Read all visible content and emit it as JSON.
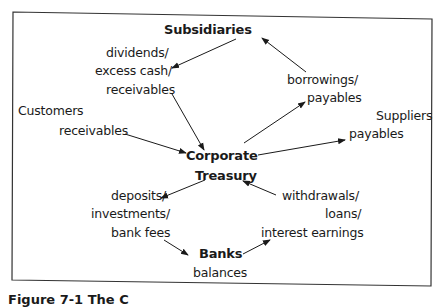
{
  "diagram": {
    "nodes": {
      "subsidiaries": "Subsidiaries",
      "corporate": "Corporate",
      "treasury": "Treasury",
      "banks": "Banks",
      "customers": "Customers",
      "suppliers": "Suppliers"
    },
    "flows": {
      "subsidiaries_to_treasury": [
        "dividends/",
        "excess cash/",
        "receivables"
      ],
      "treasury_to_subsidiaries": [
        "borrowings/",
        "payables"
      ],
      "customers_to_treasury": [
        "receivables"
      ],
      "treasury_to_suppliers": [
        "payables"
      ],
      "treasury_to_banks": [
        "deposits/",
        "investments/",
        "bank fees"
      ],
      "banks_to_treasury": [
        "withdrawals/",
        "loans/",
        "interest earnings"
      ],
      "banks_state": [
        "balances"
      ]
    },
    "edges": [
      {
        "from": "Subsidiaries",
        "to": "dividends/excess cash/receivables"
      },
      {
        "from": "dividends/excess cash/receivables",
        "to": "Corporate Treasury"
      },
      {
        "from": "Customers receivables",
        "to": "Corporate Treasury"
      },
      {
        "from": "Corporate Treasury",
        "to": "borrowings/payables"
      },
      {
        "from": "borrowings/payables",
        "to": "Subsidiaries"
      },
      {
        "from": "Corporate Treasury",
        "to": "Suppliers payables"
      },
      {
        "from": "Corporate Treasury",
        "to": "deposits/investments/bank fees"
      },
      {
        "from": "deposits/investments/bank fees",
        "to": "Banks"
      },
      {
        "from": "Banks",
        "to": "withdrawals/loans/interest earnings"
      },
      {
        "from": "withdrawals/loans/interest earnings",
        "to": "Corporate Treasury"
      }
    ],
    "caption_partial": "Figure 7-1 The C"
  }
}
